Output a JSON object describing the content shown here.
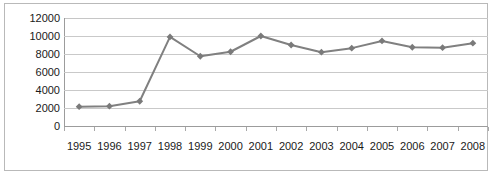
{
  "chart_data": {
    "type": "line",
    "title": "",
    "subtitle": "",
    "xlabel": "",
    "ylabel": "",
    "categories": [
      "1995",
      "1996",
      "1997",
      "1998",
      "1999",
      "2000",
      "2001",
      "2002",
      "2003",
      "2004",
      "2005",
      "2006",
      "2007",
      "2008"
    ],
    "values": [
      2150,
      2200,
      2750,
      9900,
      7750,
      8250,
      10000,
      9000,
      8200,
      8650,
      9450,
      8750,
      8700,
      9200
    ],
    "series": [
      {
        "name": "",
        "values": [
          2150,
          2200,
          2750,
          9900,
          7750,
          8250,
          10000,
          9000,
          8200,
          8650,
          9450,
          8750,
          8700,
          9200
        ]
      }
    ],
    "ylim": [
      0,
      12000
    ],
    "y_ticks": [
      0,
      2000,
      4000,
      6000,
      8000,
      10000,
      12000
    ],
    "y_tick_labels": [
      "0",
      "2000",
      "4000",
      "6000",
      "8000",
      "10000",
      "12000"
    ],
    "grid": true,
    "grid_axis": "y",
    "legend": false,
    "legend_position": "none",
    "marker": "diamond",
    "colors": {
      "series_line": "#808080",
      "marker": "#7a7a7a",
      "gridline": "#c9c9c9",
      "axis": "#9c9c9c",
      "frame_border": "#b9b9b9",
      "text": "#1a1a1a",
      "background": "#ffffff"
    }
  }
}
